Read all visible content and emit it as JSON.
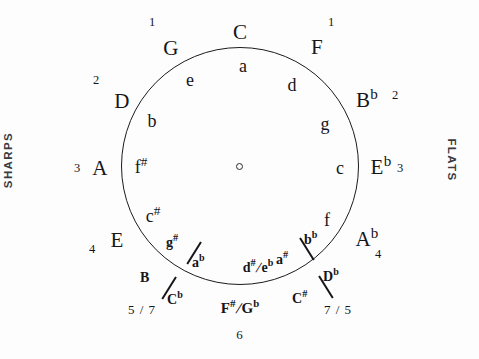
{
  "diagram": {
    "center_marker": "o",
    "side_labels": {
      "left": "SHARPS",
      "right": "FLATS"
    }
  },
  "major_keys": [
    {
      "id": "C",
      "label": "C",
      "accidental": "",
      "angle_deg": 0,
      "count": ""
    },
    {
      "id": "G",
      "label": "G",
      "accidental": "",
      "angle_deg": 30,
      "count": "1"
    },
    {
      "id": "D",
      "label": "D",
      "accidental": "",
      "angle_deg": 60,
      "count": "2"
    },
    {
      "id": "A",
      "label": "A",
      "accidental": "",
      "angle_deg": 90,
      "count": "3"
    },
    {
      "id": "E",
      "label": "E",
      "accidental": "",
      "angle_deg": 120,
      "count": "4"
    },
    {
      "id": "F",
      "label": "F",
      "accidental": "",
      "angle_deg": -30,
      "count": "1"
    },
    {
      "id": "Bb",
      "label": "B",
      "accidental": "b",
      "angle_deg": -60,
      "count": "2"
    },
    {
      "id": "Eb",
      "label": "E",
      "accidental": "b",
      "angle_deg": -90,
      "count": "3"
    },
    {
      "id": "Ab",
      "label": "A",
      "accidental": "b",
      "angle_deg": -120,
      "count": "4"
    }
  ],
  "minor_keys": [
    {
      "id": "a",
      "label": "a",
      "accidental": ""
    },
    {
      "id": "e",
      "label": "e",
      "accidental": ""
    },
    {
      "id": "b",
      "label": "b",
      "accidental": ""
    },
    {
      "id": "fs",
      "label": "f",
      "accidental": "#"
    },
    {
      "id": "cs",
      "label": "c",
      "accidental": "#"
    },
    {
      "id": "d",
      "label": "d",
      "accidental": ""
    },
    {
      "id": "g",
      "label": "g",
      "accidental": ""
    },
    {
      "id": "c",
      "label": "c",
      "accidental": ""
    },
    {
      "id": "f",
      "label": "f",
      "accidental": ""
    }
  ],
  "enharmonic": {
    "major_sharps_side": {
      "top": "B",
      "bottom": "C",
      "bottom_accidental": "b",
      "count": "5 / 7"
    },
    "major_bottom": {
      "left": "F",
      "left_accidental": "#",
      "right": "G",
      "right_accidental": "b",
      "count": "6"
    },
    "major_flats_side": {
      "left": "C",
      "left_accidental": "#",
      "right": "D",
      "right_accidental": "b",
      "count": "7 / 5"
    },
    "minor_sharps_side": {
      "top": "g",
      "top_accidental": "#",
      "bottom": "a",
      "bottom_accidental": "b"
    },
    "minor_bottom": {
      "left": "d",
      "left_accidental": "#",
      "right": "e",
      "right_accidental": "b"
    },
    "minor_flats_side": {
      "left": "a",
      "left_accidental": "#",
      "right": "b",
      "right_accidental": "b"
    }
  },
  "labels": {
    "major_C": "C",
    "major_G": "G",
    "major_D": "D",
    "major_A": "A",
    "major_E": "E",
    "major_F": "F",
    "major_Bb_letter": "B",
    "major_Bb_acc": "b",
    "major_Eb_letter": "E",
    "major_Eb_acc": "b",
    "major_Ab_letter": "A",
    "major_Ab_acc": "b",
    "minor_a": "a",
    "minor_e": "e",
    "minor_b": "b",
    "minor_fs_letter": "f",
    "minor_fs_acc": "#",
    "minor_cs_letter": "c",
    "minor_cs_acc": "#",
    "minor_d": "d",
    "minor_g": "g",
    "minor_c": "c",
    "minor_f": "f",
    "count_1_left": "1",
    "count_1_right": "1",
    "count_2_left": "2",
    "count_2_right": "2",
    "count_3_left": "3",
    "count_3_right": "3",
    "count_4_left": "4",
    "count_4_right": "4",
    "count_57": "5 / 7",
    "count_75": "7 / 5",
    "count_6": "6",
    "enh_B": "B",
    "enh_Cb_letter": "C",
    "enh_Cb_acc": "b",
    "enh_Fs_letter": "F",
    "enh_Fs_acc": "#",
    "enh_Gb_letter": "G",
    "enh_Gb_acc": "b",
    "enh_Cs_letter": "C",
    "enh_Cs_acc": "#",
    "enh_Db_letter": "D",
    "enh_Db_acc": "b",
    "enh_gs_letter": "g",
    "enh_gs_acc": "#",
    "enh_ab_letter": "a",
    "enh_ab_acc": "b",
    "enh_ds_letter": "d",
    "enh_ds_acc": "#",
    "enh_eb_letter": "e",
    "enh_eb_acc": "b",
    "enh_as_letter": "a",
    "enh_as_acc": "#",
    "enh_bb_letter": "b",
    "enh_bb_acc": "b",
    "slash": "/",
    "sharps_word": "SHARPS",
    "flats_word": "FLATS",
    "center_dot": "o"
  }
}
